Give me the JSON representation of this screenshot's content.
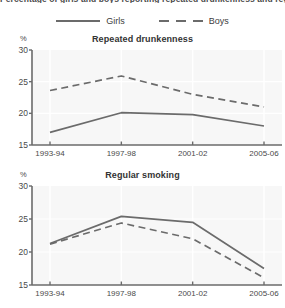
{
  "header": {
    "clipped_title": "Percentage of girls and boys reporting repeated drunkenness and regular smoking"
  },
  "legend": {
    "position": "top-center",
    "items": [
      {
        "label": "Girls",
        "style": "solid",
        "color": "#6b6b6b",
        "icon": "solid-line-swatch"
      },
      {
        "label": "Boys",
        "style": "dashed",
        "color": "#6b6b6b",
        "icon": "dashed-line-swatch"
      }
    ]
  },
  "axis": {
    "unit_label": "%",
    "yticks": [
      "30",
      "25",
      "20",
      "15"
    ],
    "xticks": [
      "1993-94",
      "1997-98",
      "2001-02",
      "2005-06"
    ]
  },
  "chart_data": [
    {
      "type": "line",
      "title": "Repeated drunkenness",
      "xlabel": "",
      "ylabel": "%",
      "ylim": [
        15,
        30
      ],
      "yticks": [
        15,
        20,
        25,
        30
      ],
      "grid": true,
      "legend_position": "top-center",
      "categories": [
        "1993-94",
        "1997-98",
        "2001-02",
        "2005-06"
      ],
      "series": [
        {
          "name": "Girls",
          "style": "solid",
          "color": "#6b6b6b",
          "values": [
            17.0,
            20.1,
            19.8,
            18.0
          ]
        },
        {
          "name": "Boys",
          "style": "dashed",
          "color": "#6b6b6b",
          "values": [
            23.6,
            25.9,
            23.0,
            21.0
          ]
        }
      ]
    },
    {
      "type": "line",
      "title": "Regular smoking",
      "xlabel": "",
      "ylabel": "%",
      "ylim": [
        15,
        30
      ],
      "yticks": [
        15,
        20,
        25,
        30
      ],
      "grid": true,
      "legend_position": "top-center",
      "categories": [
        "1993-94",
        "1997-98",
        "2001-02",
        "2005-06"
      ],
      "series": [
        {
          "name": "Girls",
          "style": "solid",
          "color": "#6b6b6b",
          "values": [
            21.3,
            25.4,
            24.5,
            17.5
          ]
        },
        {
          "name": "Boys",
          "style": "dashed",
          "color": "#6b6b6b",
          "values": [
            21.2,
            24.4,
            22.0,
            16.1
          ]
        }
      ]
    }
  ],
  "colors": {
    "line": "#6b6b6b",
    "axis": "#6b6b6b",
    "plot_background": "#f7f7f7",
    "grid": "#ffffff",
    "text": "#3d3d3d"
  }
}
